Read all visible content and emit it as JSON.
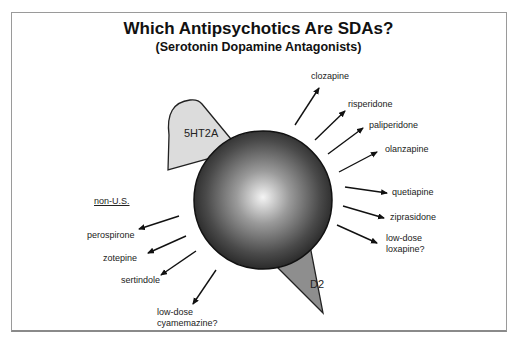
{
  "title": "Which Antipsychotics Are SDAs?",
  "subtitle": "(Serotonin Dopamine Antagonists)",
  "receptors": {
    "serotonin": "5HT2A",
    "dopamine": "D2"
  },
  "us_drugs": [
    {
      "name": "clozapine"
    },
    {
      "name": "risperidone"
    },
    {
      "name": "paliperidone"
    },
    {
      "name": "olanzapine"
    },
    {
      "name": "quetiapine"
    },
    {
      "name": "ziprasidone"
    },
    {
      "name": "low-dose",
      "name2": "loxapine?"
    }
  ],
  "non_us": {
    "heading": "non-U.S.",
    "drugs": [
      {
        "name": "perospirone"
      },
      {
        "name": "zotepine"
      },
      {
        "name": "sertindole"
      },
      {
        "name": "low-dose",
        "name2": "cyamemazine?"
      }
    ]
  },
  "colors": {
    "serotonin_receptor": "#d9d9d9",
    "dopamine_receptor": "#8c8c8c",
    "sphere_dark": "#2a2a2a",
    "sphere_light": "#f2f2f2",
    "frame": "#9a9a9a"
  }
}
